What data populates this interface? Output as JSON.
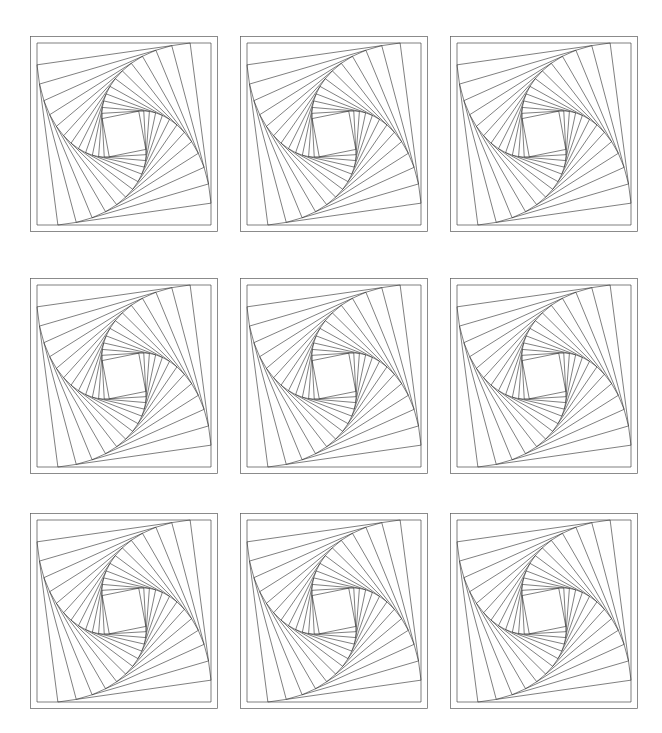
{
  "figure": {
    "background_color": "#ffffff",
    "width": 662,
    "height": 733,
    "rows": 3,
    "cols": 3
  },
  "suptitle": {
    "text": ""
  },
  "chart_data": {
    "type": "line",
    "title": "",
    "subtitle": "",
    "xlabel": "",
    "ylabel": "",
    "grid": false,
    "legend": null,
    "axis_visible": false,
    "frame_visible": true,
    "panel_count": 9,
    "panels": [
      {
        "index": 0,
        "row": 0,
        "col": 0,
        "label": "",
        "squares": 13,
        "step_fraction": 0.12,
        "rotation_sense": "clockwise"
      },
      {
        "index": 1,
        "row": 0,
        "col": 1,
        "label": "",
        "squares": 13,
        "step_fraction": 0.12,
        "rotation_sense": "clockwise"
      },
      {
        "index": 2,
        "row": 0,
        "col": 2,
        "label": "",
        "squares": 13,
        "step_fraction": 0.12,
        "rotation_sense": "clockwise"
      },
      {
        "index": 3,
        "row": 1,
        "col": 0,
        "label": "",
        "squares": 13,
        "step_fraction": 0.12,
        "rotation_sense": "clockwise"
      },
      {
        "index": 4,
        "row": 1,
        "col": 1,
        "label": "",
        "squares": 13,
        "step_fraction": 0.12,
        "rotation_sense": "clockwise"
      },
      {
        "index": 5,
        "row": 1,
        "col": 2,
        "label": "",
        "squares": 13,
        "step_fraction": 0.12,
        "rotation_sense": "clockwise"
      },
      {
        "index": 6,
        "row": 2,
        "col": 0,
        "label": "",
        "squares": 13,
        "step_fraction": 0.12,
        "rotation_sense": "clockwise"
      },
      {
        "index": 7,
        "row": 2,
        "col": 1,
        "label": "",
        "squares": 13,
        "step_fraction": 0.12,
        "rotation_sense": "clockwise"
      },
      {
        "index": 8,
        "row": 2,
        "col": 2,
        "label": "",
        "squares": 13,
        "step_fraction": 0.12,
        "rotation_sense": "clockwise"
      }
    ],
    "geometry": {
      "unit_square": [
        [
          0,
          0
        ],
        [
          1,
          0
        ],
        [
          1,
          1
        ],
        [
          0,
          1
        ]
      ],
      "step_fraction": 0.12,
      "iterations": 13,
      "line_color": "#2a2a2a",
      "frame_color": "#5a5a5a",
      "line_width": 0.6
    },
    "layout": {
      "panel_left": [
        30,
        240,
        450
      ],
      "panel_top": [
        36,
        278,
        513
      ],
      "panel_width": 188,
      "panel_height": 196,
      "xlim": [
        0,
        1
      ],
      "ylim": [
        0,
        1
      ]
    },
    "xtick_labels": [],
    "ytick_labels": []
  }
}
